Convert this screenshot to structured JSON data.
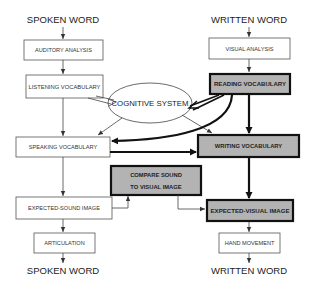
{
  "diagram": {
    "left_column": {
      "top_label": "SPOKEN WORD",
      "bottom_label": "SPOKEN WORD",
      "boxes": [
        {
          "id": "auditory-analysis",
          "label": "AUDITORY ANALYSIS",
          "highlighted": false
        },
        {
          "id": "listening-vocabulary",
          "label": "LISTENING VOCABULARY",
          "highlighted": false
        },
        {
          "id": "speaking-vocabulary",
          "label": "SPEAKING VOCABULARY",
          "highlighted": false
        },
        {
          "id": "expected-sound-image",
          "label": "EXPECTED-SOUND IMAGE",
          "highlighted": false
        },
        {
          "id": "articulation",
          "label": "ARTICULATION",
          "highlighted": false
        }
      ]
    },
    "right_column": {
      "top_label": "WRITTEN WORD",
      "bottom_label": "WRITTEN WORD",
      "boxes": [
        {
          "id": "visual-analysis",
          "label": "VISUAL ANALYSIS",
          "highlighted": false
        },
        {
          "id": "reading-vocabulary",
          "label": "READING VOCABULARY",
          "highlighted": true
        },
        {
          "id": "writing-vocabulary",
          "label": "WRITING VOCABULARY",
          "highlighted": true
        },
        {
          "id": "expected-visual-image",
          "label": "EXPECTED-VISUAL IMAGE",
          "highlighted": true
        },
        {
          "id": "hand-movement",
          "label": "HAND MOVEMENT",
          "highlighted": false
        }
      ]
    },
    "center": {
      "cognitive_system": "COGNITIVE SYSTEM",
      "compare_box": {
        "line1": "COMPARE SOUND",
        "line2": "TO VISUAL IMAGE",
        "highlighted": true
      }
    },
    "colors": {
      "highlight_fill": "#b3b3b3",
      "highlight_stroke": "#111111",
      "normal_stroke": "#555555",
      "background": "#ffffff"
    }
  }
}
